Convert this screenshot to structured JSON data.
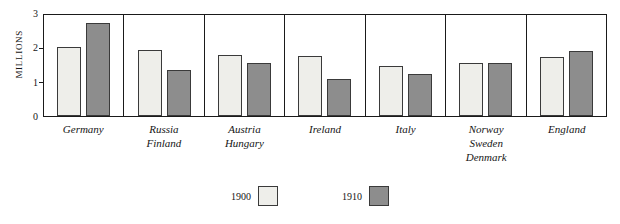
{
  "chart_data": {
    "type": "bar",
    "title": "",
    "xlabel": "",
    "ylabel": "Millions",
    "ylim": [
      0,
      3
    ],
    "yticks": [
      "0",
      "1",
      "2",
      "3"
    ],
    "grid": false,
    "legend_position": "bottom-center",
    "categories": [
      [
        "Germany"
      ],
      [
        "Russia",
        "Finland"
      ],
      [
        "Austria",
        "Hungary"
      ],
      [
        "Ireland"
      ],
      [
        "Italy"
      ],
      [
        "Norway",
        "Sweden",
        "Denmark"
      ],
      [
        "England"
      ]
    ],
    "series": [
      {
        "name": "1900",
        "color": "#eeeeea",
        "values": [
          2.0,
          1.93,
          1.78,
          1.75,
          1.45,
          1.55,
          1.72
        ]
      },
      {
        "name": "1910",
        "color": "#8d8d8d",
        "values": [
          2.71,
          1.33,
          1.55,
          1.07,
          1.22,
          1.55,
          1.88
        ]
      }
    ]
  },
  "legend": {
    "items": [
      {
        "label": "1900"
      },
      {
        "label": "1910"
      }
    ]
  }
}
